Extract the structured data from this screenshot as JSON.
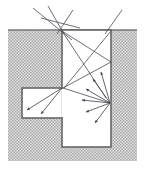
{
  "figure": {
    "caption": "",
    "background_color": "#ffffff",
    "ground": {
      "label": "hatched ground medium",
      "fill_color": "#d8d8d8",
      "stipple_color": "#9a9a9a",
      "surface_line_color": "#777777",
      "outline_color": "#666666",
      "extent": {
        "x": 8,
        "y": 30,
        "width": 129,
        "height": 131
      }
    },
    "shaft": {
      "label": "vertical shaft void",
      "fill_color": "#ffffff",
      "wall_color": "#666666",
      "wall_width": 1.6,
      "left": 62,
      "right": 111,
      "top": 30,
      "bottom": 147
    },
    "side_cavity": {
      "label": "left side cavity void",
      "fill_color": "#ffffff",
      "wall_color": "#666666",
      "wall_width": 1.6,
      "left": 22,
      "right": 62,
      "top": 88,
      "bottom": 118
    },
    "rays": {
      "line_color": "#4a4a55",
      "line_width": 0.8,
      "incident": [
        {
          "name": "incident-ray-1",
          "x1": 33,
          "y1": 8,
          "x2": 72,
          "y2": 40
        },
        {
          "name": "incident-ray-2",
          "x1": 48,
          "y1": 6,
          "x2": 64,
          "y2": 34
        },
        {
          "name": "incident-ray-3",
          "x1": 41,
          "y1": 18,
          "x2": 80,
          "y2": 28
        },
        {
          "name": "incident-ray-4",
          "x1": 73,
          "y1": 10,
          "x2": 57,
          "y2": 34
        },
        {
          "name": "incident-ray-5",
          "x1": 122,
          "y1": 10,
          "x2": 105,
          "y2": 34
        }
      ],
      "internal": [
        {
          "name": "internal-ray-1",
          "x1": 62,
          "y1": 31,
          "x2": 111,
          "y2": 62
        },
        {
          "name": "internal-ray-2",
          "x1": 62,
          "y1": 31,
          "x2": 106,
          "y2": 98
        },
        {
          "name": "internal-ray-3",
          "x1": 111,
          "y1": 31,
          "x2": 64,
          "y2": 88
        },
        {
          "name": "internal-ray-4",
          "x1": 111,
          "y1": 62,
          "x2": 63,
          "y2": 88
        },
        {
          "name": "internal-ray-5",
          "x1": 63,
          "y1": 88,
          "x2": 110,
          "y2": 103
        }
      ]
    },
    "arrows": {
      "color": "#4a4a55",
      "head_size": 3.4,
      "fan_origin": {
        "name": "scatter-point-right-wall",
        "x": 110,
        "y": 103
      },
      "fan": [
        {
          "name": "scatter-arrow-up",
          "x2": 101,
          "y2": 72
        },
        {
          "name": "scatter-arrow-upper",
          "x2": 93,
          "y2": 79
        },
        {
          "name": "scatter-arrow-upper-mid",
          "x2": 86,
          "y2": 89
        },
        {
          "name": "scatter-arrow-left",
          "x2": 82,
          "y2": 100
        },
        {
          "name": "scatter-arrow-lower-mid",
          "x2": 86,
          "y2": 112
        },
        {
          "name": "scatter-arrow-down",
          "x2": 95,
          "y2": 123
        }
      ],
      "cavity_origin": {
        "name": "scatter-point-cavity-corner",
        "x": 62,
        "y": 88
      },
      "cavity": [
        {
          "name": "cavity-arrow-far-left",
          "x2": 27,
          "y2": 110
        },
        {
          "name": "cavity-arrow-near-left",
          "x2": 41,
          "y2": 114
        }
      ]
    }
  }
}
